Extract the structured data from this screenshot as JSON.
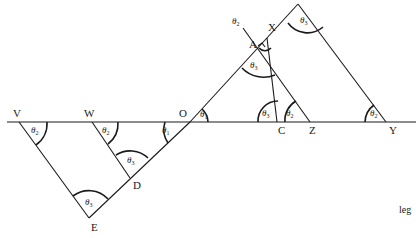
{
  "diagram": {
    "points": {
      "V": "V",
      "W": "W",
      "O": "O",
      "D": "D",
      "E": "E",
      "A": "A",
      "X": "X",
      "C": "C",
      "Z": "Z",
      "Y": "Y"
    },
    "angles": {
      "theta1": {
        "sym": "θ",
        "sub": "1"
      },
      "theta2": {
        "sym": "θ",
        "sub": "2"
      },
      "theta3": {
        "sym": "θ",
        "sub": "3"
      }
    },
    "footer_text": "leg"
  }
}
